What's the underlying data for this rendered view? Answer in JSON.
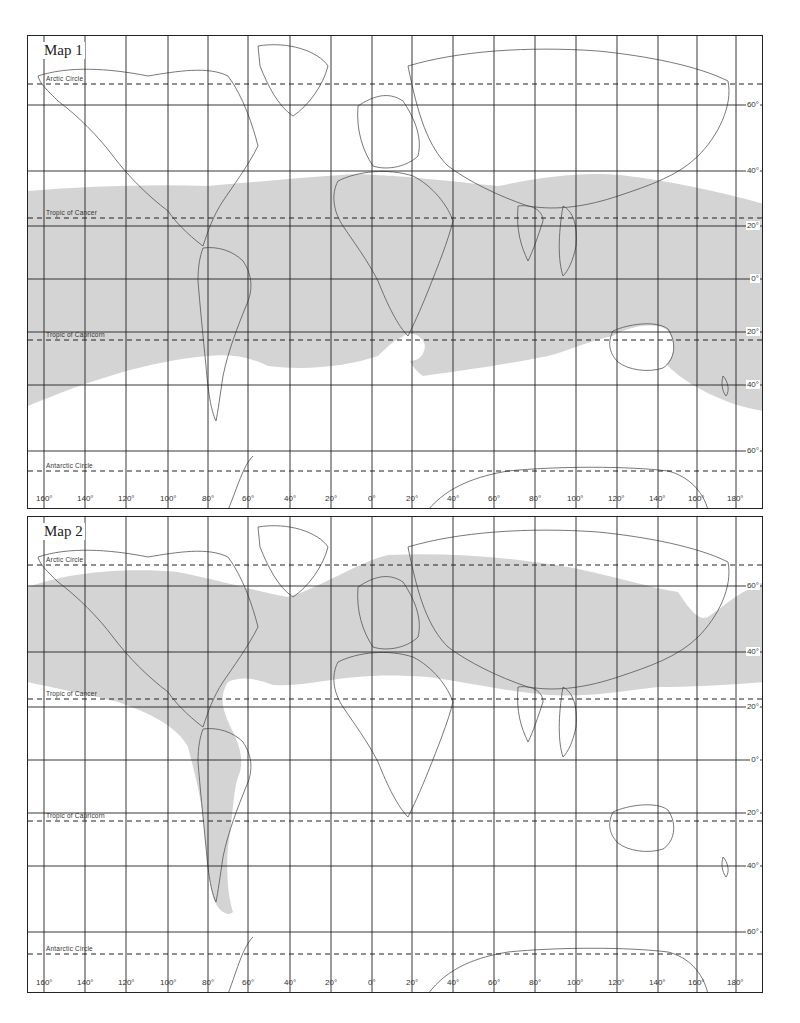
{
  "maps": [
    {
      "title": "Map 1",
      "lines": {
        "arctic_circle": "Arctic Circle",
        "tropic_of_cancer": "Tropic of Cancer",
        "tropic_of_capricorn": "Tropic of Capricorn",
        "antarctic_circle": "Antarctic Circle"
      },
      "latitude_labels": [
        "60°",
        "40°",
        "20°",
        "0°",
        "20°",
        "40°",
        "60°"
      ],
      "longitude_labels": [
        "160°",
        "140°",
        "120°",
        "100°",
        "80°",
        "60°",
        "40°",
        "20°",
        "0°",
        "20°",
        "40°",
        "60°",
        "80°",
        "100°",
        "120°",
        "140°",
        "160°",
        "180°"
      ],
      "shaded_region": "Tropical / subtropical belt roughly between 40°N and 40°S"
    },
    {
      "title": "Map 2",
      "lines": {
        "arctic_circle": "Arctic Circle",
        "tropic_of_cancer": "Tropic of Cancer",
        "tropic_of_capricorn": "Tropic of Capricorn",
        "antarctic_circle": "Antarctic Circle"
      },
      "latitude_labels": [
        "60°",
        "40°",
        "20°",
        "0°",
        "20°",
        "40°",
        "60°"
      ],
      "longitude_labels": [
        "160°",
        "140°",
        "120°",
        "100°",
        "80°",
        "60°",
        "40°",
        "20°",
        "0°",
        "20°",
        "40°",
        "60°",
        "80°",
        "100°",
        "120°",
        "140°",
        "160°",
        "180°"
      ],
      "shaded_region": "Northern temperate belt (~30°N–65°N) plus western Americas cordillera extending to Patagonia"
    }
  ],
  "colors": {
    "shade": "#d4d4d4",
    "grid": "#222222",
    "coast": "#555555",
    "background": "#ffffff"
  }
}
